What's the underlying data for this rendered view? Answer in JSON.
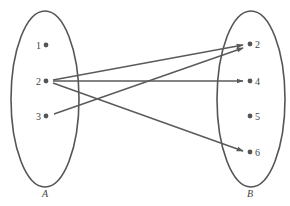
{
  "diagram": {
    "type": "function-mapping",
    "colors": {
      "stroke": "#555555",
      "arrow": "#5a5a5a",
      "text": "#444444",
      "background": "#ffffff"
    },
    "sets": [
      {
        "id": "A",
        "label": "A",
        "ellipse": {
          "cx": 45,
          "cy": 99,
          "rx": 34,
          "ry": 88
        },
        "label_pos": {
          "x": 45,
          "y": 197
        },
        "elements": [
          {
            "id": "A1",
            "label": "1",
            "x": 46,
            "y": 45
          },
          {
            "id": "A2",
            "label": "2",
            "x": 46,
            "y": 81
          },
          {
            "id": "A3",
            "label": "3",
            "x": 46,
            "y": 116
          }
        ]
      },
      {
        "id": "B",
        "label": "B",
        "ellipse": {
          "cx": 251,
          "cy": 99,
          "rx": 34,
          "ry": 88
        },
        "label_pos": {
          "x": 250,
          "y": 197
        },
        "elements": [
          {
            "id": "B2",
            "label": "2",
            "x": 250,
            "y": 44
          },
          {
            "id": "B4",
            "label": "4",
            "x": 250,
            "y": 81
          },
          {
            "id": "B5",
            "label": "5",
            "x": 250,
            "y": 116
          },
          {
            "id": "B6",
            "label": "6",
            "x": 250,
            "y": 152
          }
        ]
      }
    ],
    "mappings": [
      {
        "from": "A2",
        "to": "B2",
        "x1": 53,
        "y1": 80,
        "x2": 243,
        "y2": 45
      },
      {
        "from": "A2",
        "to": "B4",
        "x1": 53,
        "y1": 81,
        "x2": 243,
        "y2": 81
      },
      {
        "from": "A2",
        "to": "B6",
        "x1": 53,
        "y1": 83,
        "x2": 243,
        "y2": 151
      },
      {
        "from": "A3",
        "to": "B2",
        "x1": 54,
        "y1": 114,
        "x2": 243,
        "y2": 48
      }
    ]
  }
}
